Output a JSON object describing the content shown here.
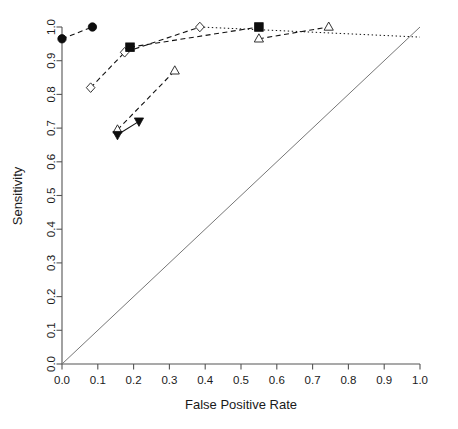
{
  "chart_data": {
    "type": "line",
    "title": "",
    "subtitle": "",
    "xlabel": "False Positive Rate",
    "ylabel": "Sensitivity",
    "xlim": [
      0.0,
      1.0
    ],
    "ylim": [
      0.0,
      1.0
    ],
    "grid": false,
    "legend_position": "none",
    "xticks": [
      "0.0",
      "0.1",
      "0.2",
      "0.3",
      "0.4",
      "0.5",
      "0.6",
      "0.7",
      "0.8",
      "0.9",
      "1.0"
    ],
    "xtick_values": [
      0.0,
      0.1,
      0.2,
      0.3,
      0.4,
      0.5,
      0.6,
      0.7,
      0.8,
      0.9,
      1.0
    ],
    "yticks": [
      "0.0",
      "0.1",
      "0.2",
      "0.3",
      "0.4",
      "0.5",
      "0.6",
      "0.7",
      "0.8",
      "0.9",
      "1.0"
    ],
    "ytick_values": [
      0.0,
      0.1,
      0.2,
      0.3,
      0.4,
      0.5,
      0.6,
      0.7,
      0.8,
      0.9,
      1.0
    ],
    "reference_line": {
      "name": "chance-diagonal",
      "x": [
        0.0,
        1.0
      ],
      "y": [
        0.0,
        1.0
      ],
      "style": "solid",
      "color": "#777777"
    },
    "series": [
      {
        "name": "filled-circle-series",
        "marker": "filled-circle",
        "line_style": "dashed",
        "color": "#0d0d0d",
        "x": [
          0.0,
          0.085
        ],
        "y": [
          0.965,
          1.0
        ]
      },
      {
        "name": "open-diamond-series",
        "marker": "open-diamond",
        "line_style": "dashed",
        "color": "#333333",
        "x": [
          0.08,
          0.175,
          0.385
        ],
        "y": [
          0.82,
          0.925,
          1.0
        ]
      },
      {
        "name": "open-diamond-dotted-tail",
        "marker": "none",
        "line_style": "dotted",
        "color": "#555555",
        "x": [
          0.385,
          1.0
        ],
        "y": [
          1.0,
          0.97
        ]
      },
      {
        "name": "filled-square-series",
        "marker": "filled-square",
        "line_style": "dashed",
        "color": "#0d0d0d",
        "x": [
          0.19,
          0.55
        ],
        "y": [
          0.94,
          1.0
        ]
      },
      {
        "name": "open-triangle-lower-series",
        "marker": "open-triangle",
        "line_style": "dashed",
        "color": "#333333",
        "x": [
          0.155,
          0.315
        ],
        "y": [
          0.695,
          0.87
        ]
      },
      {
        "name": "open-triangle-upper-series",
        "marker": "open-triangle",
        "line_style": "dashed",
        "color": "#333333",
        "x": [
          0.55,
          0.745
        ],
        "y": [
          0.965,
          1.0
        ]
      },
      {
        "name": "filled-triangle-series",
        "marker": "filled-triangle-down",
        "line_style": "solid",
        "color": "#0d0d0d",
        "x": [
          0.155,
          0.215
        ],
        "y": [
          0.68,
          0.72
        ]
      }
    ]
  },
  "axes": {
    "x_title": "False Positive Rate",
    "y_title": "Sensitivity"
  }
}
